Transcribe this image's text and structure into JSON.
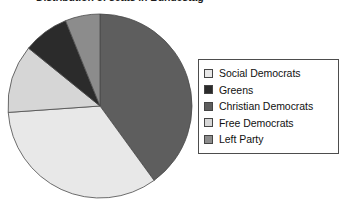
{
  "chart": {
    "title": "Distribution of seats in Bundestag",
    "title_visible_fragment": "seats in Bundestag"
  },
  "legend": {
    "position": "right",
    "items": [
      {
        "label": "Social Democrats",
        "color": "#e8e8e8",
        "swatch_name": "legend-swatch-social-democrats"
      },
      {
        "label": "Greens",
        "color": "#2b2b2b",
        "swatch_name": "legend-swatch-greens"
      },
      {
        "label": "Christian Democrats",
        "color": "#5e5e5e",
        "swatch_name": "legend-swatch-christian-democrats"
      },
      {
        "label": "Free Democrats",
        "color": "#d6d6d6",
        "swatch_name": "legend-swatch-free-democrats"
      },
      {
        "label": "Left Party",
        "color": "#8c8c8c",
        "swatch_name": "legend-swatch-left-party"
      }
    ]
  },
  "chart_data": {
    "type": "pie",
    "title": "Distribution of seats in Bundestag",
    "xlabel": "",
    "ylabel": "",
    "legend_position": "right",
    "grid": false,
    "start_angle_deg": 0,
    "direction": "clockwise",
    "categories": [
      "Christian Democrats",
      "Social Democrats",
      "Free Democrats",
      "Greens",
      "Left Party"
    ],
    "values": [
      40,
      34,
      12,
      8,
      6
    ],
    "units": "percent",
    "slices": [
      {
        "label": "Christian Democrats",
        "value": 40,
        "color": "#5e5e5e",
        "start_deg": 0,
        "end_deg": 144
      },
      {
        "label": "Social Democrats",
        "value": 34,
        "color": "#e8e8e8",
        "start_deg": 144,
        "end_deg": 266
      },
      {
        "label": "Free Democrats",
        "value": 12,
        "color": "#d6d6d6",
        "start_deg": 266,
        "end_deg": 309
      },
      {
        "label": "Greens",
        "value": 8,
        "color": "#2b2b2b",
        "start_deg": 309,
        "end_deg": 338
      },
      {
        "label": "Left Party",
        "value": 6,
        "color": "#8c8c8c",
        "start_deg": 338,
        "end_deg": 360
      }
    ]
  },
  "geometry": {
    "center_x": 100,
    "center_y": 106,
    "radius": 92
  }
}
